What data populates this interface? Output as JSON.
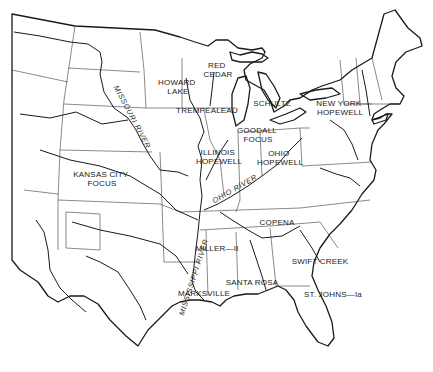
{
  "map": {
    "region": "Eastern United States",
    "colors": {
      "background": "#ffffff",
      "ink": "#1a1a1a"
    },
    "sites": [
      {
        "id": "howard-lake",
        "lines": [
          "HOWARD",
          "LAKE"
        ],
        "x": 178,
        "y": 85
      },
      {
        "id": "red-cedar",
        "lines": [
          "RED",
          "CEDAR"
        ],
        "x": 218,
        "y": 68
      },
      {
        "id": "trempealeau",
        "lines": [
          "TREMPEALEAU"
        ],
        "x": 207,
        "y": 113
      },
      {
        "id": "schultz",
        "lines": [
          "SCHULTZ"
        ],
        "x": 272,
        "y": 106
      },
      {
        "id": "new-york-hopewell",
        "lines": [
          "NEW YORK",
          "HOPEWELL"
        ],
        "x": 340,
        "y": 106
      },
      {
        "id": "goodall-focus",
        "lines": [
          "GOODALL",
          "FOCUS"
        ],
        "x": 258,
        "y": 133
      },
      {
        "id": "illinois-hopewell",
        "lines": [
          "ILLINOIS",
          "HOPEWELL"
        ],
        "x": 219,
        "y": 155
      },
      {
        "id": "ohio-hopewell",
        "lines": [
          "OHIO",
          "HOPEWELL"
        ],
        "x": 280,
        "y": 156
      },
      {
        "id": "kansas-city-focus",
        "lines": [
          "KANSAS CITY",
          "FOCUS"
        ],
        "x": 102,
        "y": 177
      },
      {
        "id": "copena",
        "lines": [
          "COPENA"
        ],
        "x": 277,
        "y": 225
      },
      {
        "id": "miller-ii",
        "lines": [
          "MILLER—II"
        ],
        "x": 217,
        "y": 251
      },
      {
        "id": "swift-creek",
        "lines": [
          "SWIFT CREEK"
        ],
        "x": 320,
        "y": 264
      },
      {
        "id": "santa-rosa",
        "lines": [
          "SANTA ROSA"
        ],
        "x": 252,
        "y": 285
      },
      {
        "id": "marksville",
        "lines": [
          "MARKSVILLE"
        ],
        "x": 204,
        "y": 296
      },
      {
        "id": "st-johns-ia",
        "lines": [
          "ST. JOHNS—Ia"
        ],
        "x": 333,
        "y": 297
      }
    ],
    "rivers": [
      {
        "id": "missouri-river",
        "label": "MISSOURI RIVER",
        "x": 130,
        "y": 118,
        "angle": 62
      },
      {
        "id": "ohio-river",
        "label": "OHIO RIVER",
        "x": 236,
        "y": 191,
        "angle": -30
      },
      {
        "id": "mississippi-river",
        "label": "MISSISSIPPI RIVER",
        "x": 196,
        "y": 278,
        "angle": -72
      }
    ]
  }
}
